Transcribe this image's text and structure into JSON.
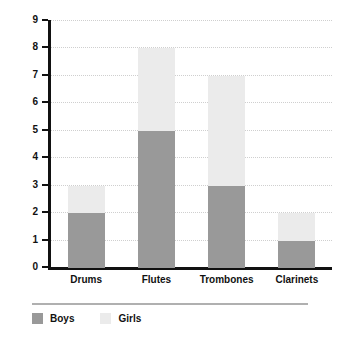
{
  "chart_data": {
    "type": "bar",
    "stacked": true,
    "title": "",
    "subtitle": "",
    "xlabel": "",
    "ylabel": "",
    "categories": [
      "Drums",
      "Flutes",
      "Trombones",
      "Clarinets"
    ],
    "series": [
      {
        "name": "Boys",
        "values": [
          2,
          5,
          3,
          1
        ],
        "color": "#999999"
      },
      {
        "name": "Girls",
        "values": [
          1,
          3,
          4,
          1
        ],
        "color": "#ebebeb"
      }
    ],
    "totals": [
      3,
      8,
      7,
      2
    ],
    "ylim": [
      0,
      9
    ],
    "ytick_labels": [
      "0",
      "1",
      "2",
      "3",
      "4",
      "5",
      "6",
      "7",
      "8",
      "9"
    ],
    "ytick_values": [
      0,
      1,
      2,
      3,
      4,
      5,
      6,
      7,
      8,
      9
    ],
    "grid": "horizontal-dotted",
    "legend_position": "bottom-left",
    "axis_color": "#111111",
    "grid_color": "#cfcfcf",
    "background": "#ffffff"
  },
  "legend": {
    "entries": [
      {
        "label": "Boys",
        "color": "#999999"
      },
      {
        "label": "Girls",
        "color": "#ebebeb"
      }
    ]
  }
}
